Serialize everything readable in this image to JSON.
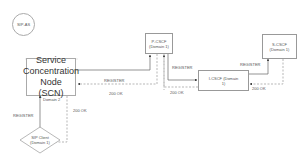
{
  "diagram": {
    "nodes": {
      "sip_as": {
        "label": "SIP-AS"
      },
      "scn": {
        "label_line1": "Service",
        "label_line2": "Concentration",
        "label_line3": "Node (SCN)"
      },
      "p_cscf": {
        "label_line1": "P-CSCF",
        "label_line2": "(Domain 1)"
      },
      "i_cscf": {
        "label_line1": "I-CSCF (Domain",
        "label_line2": "1)"
      },
      "s_cscf": {
        "label_line1": "S-CSCF",
        "label_line2": "(Domain 1)"
      },
      "sip_client": {
        "label_line1": "SIP Client",
        "label_line2": "(Domain 1)"
      }
    },
    "edges": {
      "client_to_scn": {
        "label": "REGISTER"
      },
      "scn_to_client": {
        "label": "200 OK"
      },
      "domain_label": {
        "label": "Domain 2"
      },
      "scn_to_pcscf": {
        "label": "REGISTER"
      },
      "pcscf_to_scn": {
        "label": "200 OK"
      },
      "pcscf_to_icscf": {
        "label": "REGISTER"
      },
      "icscf_to_pcscf": {
        "label": "200 OK"
      },
      "icscf_to_scscf": {
        "label": "REGISTER"
      },
      "scscf_to_icscf": {
        "label": "200 OK"
      }
    },
    "colors": {
      "line": "#666666",
      "dashed": "#888888",
      "border": "#999999"
    }
  }
}
